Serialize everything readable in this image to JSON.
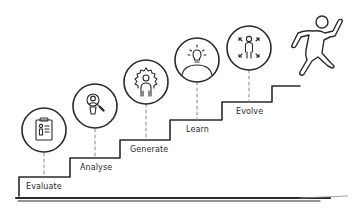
{
  "diagram": {
    "type": "staircase-process",
    "steps": [
      {
        "label": "Evaluate",
        "icon": "clipboard-person-icon"
      },
      {
        "label": "Analyse",
        "icon": "magnifier-person-icon"
      },
      {
        "label": "Generate",
        "icon": "gear-person-icon"
      },
      {
        "label": "Learn",
        "icon": "lightbulb-person-icon"
      },
      {
        "label": "Evolve",
        "icon": "expand-arrows-person-icon"
      }
    ],
    "figure": "running-person-climbing-icon",
    "colors": {
      "stroke": "#2a2a2a",
      "background": "#ffffff",
      "dash": "#8a8a8a"
    }
  }
}
